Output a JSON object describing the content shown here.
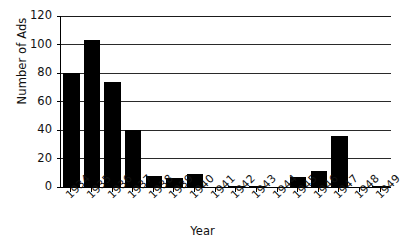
{
  "chart_data": {
    "type": "bar",
    "title": "",
    "xlabel": "Year",
    "ylabel": "Number of Ads",
    "categories": [
      "1934",
      "1935",
      "1936",
      "1937",
      "1938",
      "1939",
      "1940",
      "1941",
      "1942",
      "1943",
      "1944",
      "1945",
      "1946",
      "1947",
      "1948",
      "1949"
    ],
    "values": [
      80,
      103,
      74,
      40,
      8,
      6,
      9,
      0,
      1,
      1,
      0,
      7,
      11,
      36,
      0,
      1
    ],
    "ylim": [
      0,
      120
    ],
    "yticks": [
      0,
      20,
      40,
      60,
      80,
      100,
      120
    ],
    "ytick_labels": [
      "0",
      "20",
      "40",
      "60",
      "80",
      "100",
      "120"
    ],
    "grid": "horizontal",
    "legend": "none",
    "bar_color": "#000000",
    "background_color": "#ffffff",
    "axis_color": "#000000",
    "xtick_rotation": "-45"
  }
}
